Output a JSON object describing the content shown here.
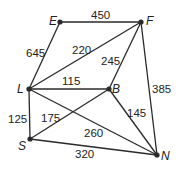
{
  "graph": {
    "nodes": [
      {
        "id": "E",
        "label": "E",
        "x": 60,
        "y": 22
      },
      {
        "id": "F",
        "label": "F",
        "x": 141,
        "y": 22
      },
      {
        "id": "L",
        "label": "L",
        "x": 29,
        "y": 89
      },
      {
        "id": "B",
        "label": "B",
        "x": 109,
        "y": 89
      },
      {
        "id": "S",
        "label": "S",
        "x": 30,
        "y": 139
      },
      {
        "id": "N",
        "label": "N",
        "x": 157,
        "y": 155
      }
    ],
    "edges": [
      {
        "from": "E",
        "to": "F",
        "weight": "450"
      },
      {
        "from": "E",
        "to": "L",
        "weight": "645"
      },
      {
        "from": "L",
        "to": "F",
        "weight": "220"
      },
      {
        "from": "B",
        "to": "F",
        "weight": "245"
      },
      {
        "from": "F",
        "to": "N",
        "weight": "385"
      },
      {
        "from": "L",
        "to": "B",
        "weight": "115"
      },
      {
        "from": "L",
        "to": "S",
        "weight": "125"
      },
      {
        "from": "S",
        "to": "B",
        "weight": "175"
      },
      {
        "from": "L",
        "to": "N",
        "weight": "260"
      },
      {
        "from": "B",
        "to": "N",
        "weight": "145"
      },
      {
        "from": "S",
        "to": "N",
        "weight": "320"
      }
    ]
  }
}
